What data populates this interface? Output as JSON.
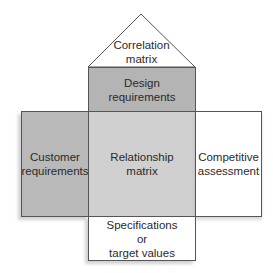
{
  "diagram": {
    "type": "house-of-quality",
    "sections": {
      "roof": {
        "label_line1": "Correlation",
        "label_line2": "matrix"
      },
      "design": {
        "label_line1": "Design",
        "label_line2": "requirements",
        "color": "#b4b4b4"
      },
      "customer": {
        "label_line1": "Customer",
        "label_line2": "requirements",
        "color": "#b9b9b9"
      },
      "relationship": {
        "label_line1": "Relationship",
        "label_line2": "matrix",
        "color": "#d0d0d0"
      },
      "competitive": {
        "label_line1": "Competitive",
        "label_line2": "assessment",
        "color": "#ffffff"
      },
      "specifications": {
        "label_line1": "Specifications",
        "label_line2": "or",
        "label_line3": "target values",
        "color": "#ffffff"
      }
    }
  }
}
